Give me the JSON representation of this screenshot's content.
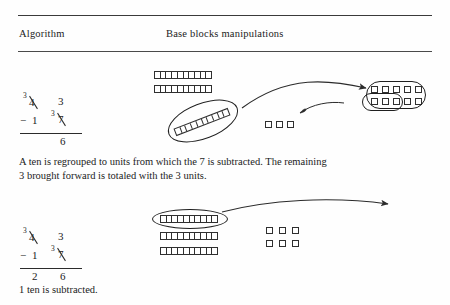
{
  "header": {
    "col_algorithm": "Algorithm",
    "col_blocks": "Base blocks manipulations"
  },
  "steps": [
    {
      "id": "step-1",
      "algorithm": {
        "top_row": {
          "tens_sup": "3",
          "tens_digit": "4",
          "tens_struck": true,
          "units_digit": "3",
          "units_struck": false
        },
        "sub_row": {
          "operator": "−",
          "tens_digit": "1",
          "units_sup": "3",
          "units_digit": "7",
          "units_struck": true
        },
        "result": {
          "tens_digit": "",
          "units_digit": "6"
        }
      },
      "caption": "A ten is regrouped to units from which the 7 is subtracted. The remaining 3 brought forward is totaled with the 3 units.",
      "blocks": {
        "rods_stacked": 2,
        "rod_segments": 10,
        "rod_tilted": 1,
        "loose_units": 3,
        "regrouped_units_row_top": 5,
        "regrouped_units_row_bottom": 5,
        "circled_units_in_group": 3
      }
    },
    {
      "id": "step-2",
      "algorithm": {
        "top_row": {
          "tens_sup": "3",
          "tens_digit": "4",
          "tens_struck": true,
          "units_digit": "3",
          "units_struck": false
        },
        "sub_row": {
          "operator": "−",
          "tens_digit": "1",
          "units_sup": "3",
          "units_digit": "7",
          "units_struck": true
        },
        "result": {
          "tens_digit": "2",
          "units_digit": "6"
        }
      },
      "caption": "1 ten is subtracted.",
      "blocks": {
        "rods_stacked": 3,
        "rod_segments": 10,
        "circled_rod_index": 1,
        "unit_rows": 2,
        "units_per_row": 3
      }
    }
  ],
  "colors": {
    "ink": "#1c1c1c",
    "rule": "#3a3a3a",
    "stroke": "#2f2f2f",
    "ring": "#1f1f1f",
    "paper": "#fefefe"
  },
  "icons": {
    "ring": "ellipse-ring",
    "arrow": "curved-arrow"
  }
}
